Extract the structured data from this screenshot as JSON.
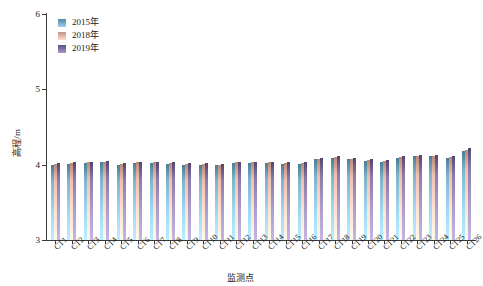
{
  "chart_data": {
    "type": "bar",
    "title": "",
    "xlabel": "监测点",
    "ylabel": "高程/m",
    "ylim": [
      3,
      6
    ],
    "yticks": [
      3,
      4,
      5,
      6
    ],
    "grid": false,
    "legend_position": "top-left",
    "categories": [
      "CT1",
      "CT2",
      "CT3",
      "CT4",
      "CT5",
      "CT6",
      "CT7",
      "CT8",
      "CT9",
      "CT10",
      "CT11",
      "CT12",
      "CT13",
      "CT14",
      "CT15",
      "CT16",
      "CT17",
      "CT18",
      "CT19",
      "CT20",
      "CT21",
      "CT22",
      "CT23",
      "CT24",
      "CT25",
      "CT26"
    ],
    "series": [
      {
        "name": "2015年",
        "color": "#7fb5cc",
        "values": [
          4.0,
          4.01,
          4.02,
          4.03,
          4.0,
          4.02,
          4.02,
          4.01,
          4.0,
          4.0,
          3.99,
          4.02,
          4.02,
          4.02,
          4.01,
          4.01,
          4.07,
          4.09,
          4.07,
          4.05,
          4.04,
          4.09,
          4.11,
          4.11,
          4.09,
          4.18
        ]
      },
      {
        "name": "2018年",
        "color": "#f0bfb0",
        "values": [
          4.01,
          4.02,
          4.03,
          4.04,
          4.01,
          4.03,
          4.03,
          4.02,
          4.01,
          4.01,
          4.0,
          4.03,
          4.03,
          4.03,
          4.02,
          4.02,
          4.08,
          4.1,
          4.08,
          4.06,
          4.05,
          4.1,
          4.12,
          4.12,
          4.1,
          4.2
        ]
      },
      {
        "name": "2019年",
        "color": "#8a7ba8",
        "values": [
          4.02,
          4.03,
          4.04,
          4.05,
          4.02,
          4.04,
          4.04,
          4.03,
          4.02,
          4.02,
          4.01,
          4.04,
          4.04,
          4.04,
          4.03,
          4.03,
          4.09,
          4.11,
          4.09,
          4.07,
          4.06,
          4.11,
          4.13,
          4.13,
          4.11,
          4.22
        ]
      }
    ]
  },
  "legend": {
    "items": [
      {
        "label": "2015年",
        "color": "#7fb5cc"
      },
      {
        "label": "2018年",
        "color": "#f0bfb0"
      },
      {
        "label": "2019年",
        "color": "#8a7ba8"
      }
    ]
  }
}
